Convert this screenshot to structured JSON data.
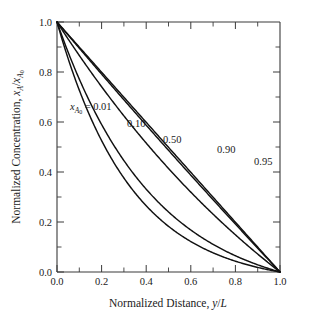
{
  "chart_data": {
    "type": "line",
    "title": "",
    "xlabel": "Normalized Distance, y/L",
    "ylabel": "Normalized Concentration, xA/xA0",
    "xlim": [
      0.0,
      1.0
    ],
    "ylim": [
      0.0,
      1.0
    ],
    "grid": false,
    "legend_position": "inline-curve-labels",
    "annotation": "xA0 = 0.01",
    "x": [
      0.0,
      0.05,
      0.1,
      0.15,
      0.2,
      0.25,
      0.3,
      0.35,
      0.4,
      0.45,
      0.5,
      0.55,
      0.6,
      0.65,
      0.7,
      0.75,
      0.8,
      0.85,
      0.9,
      0.95,
      1.0
    ],
    "series": [
      {
        "name": "0.01",
        "label": "0.01",
        "values": [
          1.0,
          0.9499,
          0.8998,
          0.8497,
          0.7995,
          0.7494,
          0.6993,
          0.6491,
          0.5989,
          0.5488,
          0.4986,
          0.4484,
          0.3982,
          0.348,
          0.2978,
          0.2475,
          0.1973,
          0.147,
          0.0968,
          0.0465,
          0.0
        ]
      },
      {
        "name": "0.10",
        "label": "0.10",
        "values": [
          1.0,
          0.9488,
          0.8975,
          0.8461,
          0.7946,
          0.7429,
          0.6911,
          0.6392,
          0.5871,
          0.5349,
          0.4826,
          0.4301,
          0.3775,
          0.3247,
          0.2718,
          0.2188,
          0.1656,
          0.1123,
          0.0588,
          0.0052,
          0.0
        ]
      },
      {
        "name": "0.50",
        "label": "0.50",
        "values": [
          1.0,
          0.9397,
          0.8784,
          0.8159,
          0.7522,
          0.6873,
          0.6212,
          0.5538,
          0.4851,
          0.415,
          0.3437,
          0.2709,
          0.1968,
          0.1212,
          0.0442,
          0.0,
          0.0,
          0.0,
          0.0,
          0.0,
          0.0
        ]
      },
      {
        "name": "0.90",
        "label": "0.90",
        "values": [
          1.0,
          0.9866,
          0.9713,
          0.9539,
          0.9339,
          0.911,
          0.8847,
          0.8546,
          0.82,
          0.7803,
          0.7348,
          0.6826,
          0.6227,
          0.554,
          0.4753,
          0.385,
          0.2815,
          0.1628,
          0.0267,
          0.0,
          0.0
        ]
      },
      {
        "name": "0.95",
        "label": "0.95",
        "values": [
          1.0,
          0.9929,
          0.9846,
          0.9751,
          0.964,
          0.9512,
          0.9363,
          0.9191,
          0.8992,
          0.8761,
          0.8494,
          0.8184,
          0.7825,
          0.741,
          0.6929,
          0.6372,
          0.5727,
          0.4981,
          0.4117,
          0.3115,
          0.0
        ]
      }
    ],
    "xticks": [
      0.0,
      0.2,
      0.4,
      0.6,
      0.8,
      1.0
    ],
    "xticklabels": [
      "0.0",
      "0.2",
      "0.4",
      "0.6",
      "0.8",
      "1.0"
    ],
    "xminorticks": [
      0.1,
      0.3,
      0.5,
      0.7,
      0.9
    ],
    "yticks": [
      0.0,
      0.2,
      0.4,
      0.6,
      0.8,
      1.0
    ],
    "yticklabels": [
      "0.0",
      "0.2",
      "0.4",
      "0.6",
      "0.8",
      "1.0"
    ],
    "yminorticks": [
      0.1,
      0.3,
      0.5,
      0.7,
      0.9
    ],
    "colors": {
      "curve": "#111111",
      "axis": "#3a3a3a",
      "background": "#ffffff"
    }
  },
  "axes": {
    "x_tick_labels": [
      "0.0",
      "0.2",
      "0.4",
      "0.6",
      "0.8",
      "1.0"
    ],
    "y_tick_labels": [
      "0.0",
      "0.2",
      "0.4",
      "0.6",
      "0.8",
      "1.0"
    ],
    "xlabel_parts": {
      "text": "Normalized Distance, ",
      "var_y": "y",
      "slash": "/",
      "var_L": "L"
    },
    "ylabel_parts": {
      "text": "Normalized Concentration, ",
      "var_x1": "x",
      "sub1": "A",
      "slash": "/",
      "var_x2": "x",
      "sub2": "A",
      "subsub2": "0"
    }
  },
  "annotation": {
    "var": "x",
    "sub_a": "A",
    "sub_zero": "0",
    "equals_value": "= 0.01"
  },
  "curve_labels": {
    "c1": "0.10",
    "c2": "0.50",
    "c3": "0.90",
    "c4": "0.95"
  }
}
